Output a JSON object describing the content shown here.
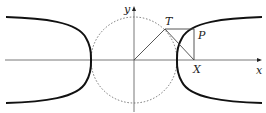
{
  "diagram": {
    "type": "hyperbola-construction",
    "labels": {
      "y_axis": "y",
      "x_axis": "x",
      "point_T": "T",
      "point_P": "P",
      "point_X": "X"
    },
    "elements": [
      "x-axis",
      "y-axis",
      "unit circle (dashed)",
      "hyperbola (two branches, bold)",
      "segment O-T",
      "tangent T-X",
      "horizontal T-P",
      "vertical P-X"
    ],
    "colors": {
      "curve": "#111111",
      "axes": "#555555",
      "circle": "#666666",
      "construction": "#444444"
    }
  }
}
